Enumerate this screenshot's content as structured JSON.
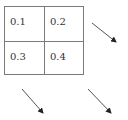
{
  "diagram": {
    "cells": [
      {
        "label": "0.1",
        "row": 0,
        "col": 0
      },
      {
        "label": "0.2",
        "row": 0,
        "col": 1
      },
      {
        "label": "0.3",
        "row": 1,
        "col": 0
      },
      {
        "label": "0.4",
        "row": 1,
        "col": 1
      }
    ],
    "arrows": [
      {
        "from": [
          92,
          23
        ],
        "to": [
          117,
          43
        ],
        "direction": "down-right"
      },
      {
        "from": [
          22,
          89
        ],
        "to": [
          44,
          114
        ],
        "direction": "down-right"
      },
      {
        "from": [
          88,
          89
        ],
        "to": [
          112,
          114
        ],
        "direction": "down-right"
      }
    ],
    "colors": {
      "grid_line": "#7a7a7a",
      "text": "#333333",
      "arrow": "#333333"
    }
  }
}
